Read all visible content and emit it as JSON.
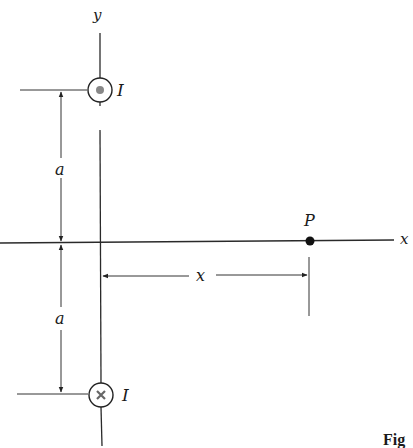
{
  "figure": {
    "axes": {
      "y_label": "y",
      "x_label": "x"
    },
    "wires": [
      {
        "name": "top",
        "current_label": "I",
        "direction": "out-of-page",
        "symbol": "dot"
      },
      {
        "name": "bottom",
        "current_label": "I",
        "direction": "into-page",
        "symbol": "cross"
      }
    ],
    "dimensions": {
      "upper_a": "a",
      "lower_a": "a",
      "distance": "x"
    },
    "point": {
      "label": "P"
    },
    "caption": "Fig"
  },
  "colors": {
    "ink": "#1a1a1a",
    "dot_fill": "#888888",
    "background": "#ffffff"
  }
}
